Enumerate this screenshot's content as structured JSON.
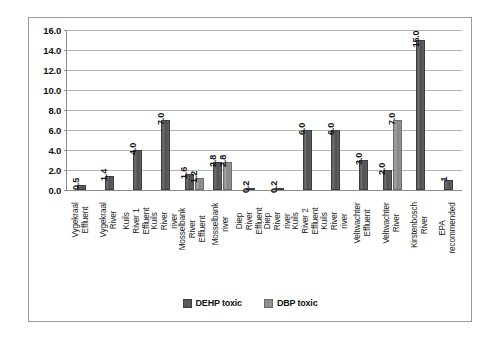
{
  "chart_data": {
    "type": "bar",
    "title": "",
    "subtitle": "",
    "xlabel": "",
    "ylabel": "",
    "ylim": [
      0,
      16
    ],
    "ytick_labels": [
      "0.0",
      "2.0",
      "4.0",
      "6.0",
      "8.0",
      "10.0",
      "12.0",
      "14.0",
      "16.0"
    ],
    "ytick_values": [
      0,
      2,
      4,
      6,
      8,
      10,
      12,
      14,
      16
    ],
    "grid": true,
    "legend_position": "bottom",
    "categories": [
      "Vygekraal Effluent",
      "Vygekraal River",
      "Kuils River 1 Effluent",
      "Kuils River river",
      "Mosselbank River Effluent",
      "Mosselbank river",
      "Diep River Effluent",
      "Diep River river",
      "Kuils River 2 Effluent",
      "Kuils River river",
      "Veltwachter Effluent",
      "Veltwachter River",
      "Kirstenbosch River",
      "EPA recommended"
    ],
    "series": [
      {
        "name": "DEHP toxic",
        "color": "#5a5a5a",
        "values": [
          0.5,
          1.4,
          4.0,
          7.0,
          1.6,
          2.8,
          0.2,
          0.2,
          6.0,
          6.0,
          3.0,
          2.0,
          15.0,
          1
        ],
        "labels": [
          "0.5",
          "1.4",
          "4.0",
          "7.0",
          "1.6",
          "2.8",
          "0.2",
          "0.2",
          "6.0",
          "6.0",
          "3.0",
          "2.0",
          "15.0",
          "1"
        ]
      },
      {
        "name": "DBP toxic",
        "color": "#8e8e8e",
        "values": [
          null,
          null,
          null,
          null,
          1.2,
          2.8,
          null,
          null,
          null,
          null,
          null,
          7.0,
          null,
          null
        ],
        "labels": [
          null,
          null,
          null,
          null,
          "1.2",
          "2.8",
          null,
          null,
          null,
          null,
          null,
          "7.0",
          null,
          null
        ]
      }
    ]
  },
  "legend": {
    "items": [
      {
        "label": "DEHP toxic",
        "swatch": "dehp"
      },
      {
        "label": "DBP toxic",
        "swatch": "dbp"
      }
    ]
  }
}
